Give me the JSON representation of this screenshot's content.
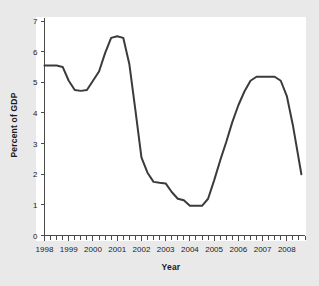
{
  "figure": {
    "background_color": "#e9e9e9",
    "panel_color": "#ffffff",
    "axis_color": "#4a4a4a"
  },
  "chart_data": {
    "type": "line",
    "title": "",
    "xlabel": "Year",
    "ylabel": "Percent of GDP",
    "xlim": [
      1998.0,
      2008.75
    ],
    "ylim": [
      0,
      7
    ],
    "grid": false,
    "legend": null,
    "line_color": "#3b3b3b",
    "line_width": 2,
    "xticks": [
      1998,
      1999,
      2000,
      2001,
      2002,
      2003,
      2004,
      2005,
      2006,
      2007,
      2008
    ],
    "xtick_labels": [
      "1998",
      "1999",
      "2000",
      "2001",
      "2002",
      "2003",
      "2004",
      "2005",
      "2006",
      "2007",
      "2008"
    ],
    "minor_xtick_interval": 0.25,
    "yticks": [
      0,
      1,
      2,
      3,
      4,
      5,
      6,
      7
    ],
    "ytick_labels": [
      "0",
      "1",
      "2",
      "3",
      "4",
      "5",
      "6",
      "7"
    ],
    "series": [
      {
        "name": "Percent of GDP",
        "x": [
          1998.0,
          1998.25,
          1998.5,
          1998.75,
          1999.0,
          1999.25,
          1999.5,
          1999.75,
          2000.0,
          2000.25,
          2000.5,
          2000.75,
          2001.0,
          2001.25,
          2001.5,
          2001.75,
          2002.0,
          2002.25,
          2002.5,
          2002.75,
          2003.0,
          2003.25,
          2003.5,
          2003.75,
          2004.0,
          2004.25,
          2004.5,
          2004.75,
          2005.0,
          2005.25,
          2005.5,
          2005.75,
          2006.0,
          2006.25,
          2006.5,
          2006.75,
          2007.0,
          2007.25,
          2007.5,
          2007.75,
          2008.0,
          2008.25,
          2008.6
        ],
        "values": [
          5.55,
          5.55,
          5.55,
          5.5,
          5.05,
          4.75,
          4.72,
          4.75,
          5.05,
          5.35,
          5.95,
          6.45,
          6.5,
          6.45,
          5.6,
          4.1,
          2.55,
          2.05,
          1.75,
          1.72,
          1.7,
          1.42,
          1.2,
          1.15,
          0.97,
          0.97,
          0.97,
          1.2,
          1.8,
          2.45,
          3.05,
          3.7,
          4.25,
          4.7,
          5.05,
          5.18,
          5.18,
          5.18,
          5.18,
          5.05,
          4.55,
          3.6,
          2.0
        ]
      }
    ]
  }
}
